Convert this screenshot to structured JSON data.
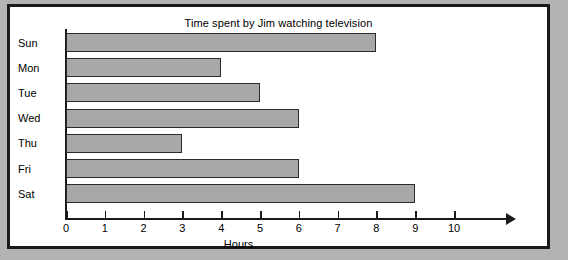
{
  "chart_data": {
    "type": "bar",
    "orientation": "horizontal",
    "title": "Time spent by Jim watching television",
    "xlabel": "Hours",
    "ylabel": "",
    "categories": [
      "Sun",
      "Mon",
      "Tue",
      "Wed",
      "Thu",
      "Fri",
      "Sat"
    ],
    "values": [
      8,
      4,
      5,
      6,
      3,
      6,
      9
    ],
    "xticks": [
      "0",
      "1",
      "2",
      "3",
      "4",
      "5",
      "6",
      "7",
      "8",
      "9",
      "10"
    ],
    "xlim": [
      0,
      10
    ],
    "grid": false,
    "legend": false,
    "bar_color": "#a8a8a8",
    "bar_border_color": "#2b2b2b",
    "axis_color": "#1a1a1a",
    "background_color": "#ffffff",
    "page_background_color": "#b3b3b3",
    "frame_color": "#1a1a1a"
  }
}
